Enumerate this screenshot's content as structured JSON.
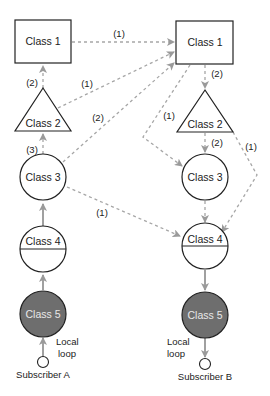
{
  "diagram": {
    "left": {
      "class1": "Class 1",
      "class2": "Class 2",
      "class3": "Class 3",
      "class4": "Class 4",
      "class5": "Class 5",
      "local_loop_line1": "Local",
      "local_loop_line2": "loop",
      "subscriber": "Subscriber A"
    },
    "right": {
      "class1": "Class 1",
      "class2": "Class 2",
      "class3": "Class 3",
      "class4": "Class 4",
      "class5": "Class 5",
      "local_loop_line1": "Local",
      "local_loop_line2": "loop",
      "subscriber": "Subscriber B"
    },
    "route_labels": {
      "l_class1_to_r_class1": "(1)",
      "l_class2_to_l_class1": "(2)",
      "l_class2_to_r_class1": "(1)",
      "l_class3_to_l_class2": "(3)",
      "l_class3_to_r_class1": "(2)",
      "l_class3_to_r_class4": "(1)",
      "r_class1_to_r_class2": "(2)",
      "r_class1_to_r_class3": "(1)",
      "r_class2_to_r_class3": "(2)",
      "r_class2_to_r_class4": "(1)"
    },
    "colors": {
      "stroke": "#222222",
      "dashed": "#9a9a9a",
      "solid_link": "#a0a0a0",
      "class5_fill": "#6e6e6e",
      "class5_text": "#e8e8e8"
    }
  }
}
